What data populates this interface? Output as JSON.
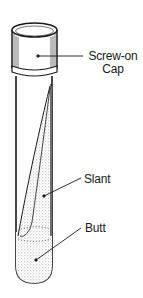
{
  "figure": {
    "labels": {
      "cap_line1": "Screw-on",
      "cap_line2": "Cap",
      "slant": "Slant",
      "butt": "Butt"
    },
    "colors": {
      "ink": "#1a1a1a",
      "stipple": "#bdbdbd",
      "background": "#ffffff"
    }
  }
}
